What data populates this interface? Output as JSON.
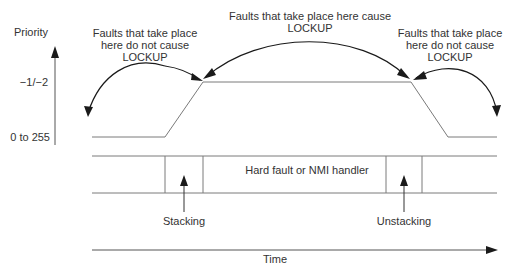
{
  "axis": {
    "y_label": "Priority",
    "y_ticks": [
      "−1/−2",
      "0 to 255"
    ],
    "x_label": "Time"
  },
  "annotations": {
    "left": "Faults that take place\nhere do not cause\nLOCKUP",
    "middle": "Faults that take place here cause\nLOCKUP",
    "right": "Faults that take place\nhere do not cause\nLOCKUP"
  },
  "timeline": {
    "handler_label": "Hard fault or NMI handler",
    "stacking_label": "Stacking",
    "unstacking_label": "Unstacking"
  },
  "colors": {
    "line": "#7a7a7a",
    "arrow": "#1a1a1a",
    "text": "#333333"
  }
}
